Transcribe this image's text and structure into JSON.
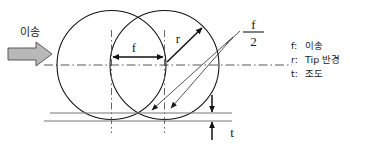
{
  "figure": {
    "feed_label": "이송",
    "feed_icon": "right-block-arrow",
    "labels": {
      "feed_dim": "f",
      "radius_dim": "r",
      "half_feed_numerator": "f",
      "half_feed_denominator": "2",
      "roughness_dim": "t"
    },
    "legend": [
      {
        "symbol": "f:",
        "meaning": "이송"
      },
      {
        "symbol": "r:",
        "meaning": "Tip 반경"
      },
      {
        "symbol": "t:",
        "meaning": "조도"
      }
    ],
    "colors": {
      "stroke": "#111111",
      "center_line": "#444444",
      "reference_line": "#777777",
      "feed_arrow_fill": "#b8b8b8",
      "feed_arrow_stroke": "#4a4a4a",
      "background": "#ffffff"
    }
  },
  "geometry": {
    "left_circle": {
      "cx": 111.5,
      "cy": 65,
      "r": 54.5
    },
    "right_circle": {
      "cx": 164.5,
      "cy": 65,
      "r": 54.5
    },
    "feed_distance": 53,
    "reference_line_upper_y": 113,
    "reference_line_lower_y": 121
  }
}
